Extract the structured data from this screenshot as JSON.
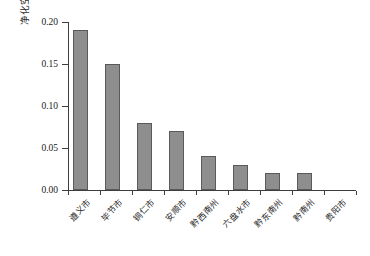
{
  "chart_data": {
    "type": "bar",
    "title": "",
    "xlabel": "",
    "ylabel": "净化空气价值变化/亿元",
    "categories": [
      "遵义市",
      "毕节市",
      "铜仁市",
      "安顺市",
      "黔西南州",
      "六盘水市",
      "黔东南州",
      "黔南州",
      "贵阳市"
    ],
    "values": [
      0.19,
      0.15,
      0.08,
      0.07,
      0.04,
      0.03,
      0.02,
      0.02,
      0.0
    ],
    "ylim": [
      0.0,
      0.2
    ],
    "ytick_labels": [
      "0.00",
      "0.05",
      "0.10",
      "0.15",
      "0.20"
    ],
    "ytick_values": [
      0.0,
      0.05,
      0.1,
      0.15,
      0.2
    ],
    "grid": false,
    "legend": false,
    "bar_color": "#8e8e8e",
    "bar_edge_color": "#5a5a5a",
    "axis_color": "#3d3d3d",
    "background": "#ffffff"
  }
}
